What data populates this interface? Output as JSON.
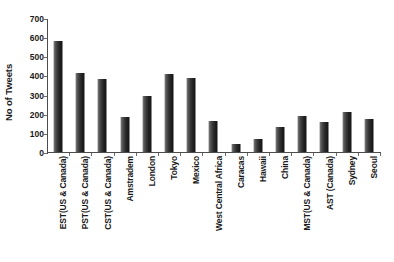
{
  "top_clipped_text": "",
  "chart_data": {
    "type": "bar",
    "title": "",
    "xlabel": "",
    "ylabel": "No of Tweets",
    "ylim": [
      0,
      700
    ],
    "yticks": [
      0,
      100,
      200,
      300,
      400,
      500,
      600,
      700
    ],
    "grid": false,
    "legend": null,
    "bar_color": "#2b2b2b",
    "axis_color": "#4d4d4d",
    "categories": [
      "EST(US & Canada)",
      "PST(US & Canada)",
      "CST(US & Canada)",
      "Amstradem",
      "London",
      "Tokyo",
      "Mexico",
      "West Central Africa",
      "Caracas",
      "Hawaii",
      "China",
      "MST(US & Canada)",
      "AST (Canada)",
      "Sydney",
      "Seoul"
    ],
    "values": [
      578,
      412,
      382,
      185,
      293,
      408,
      388,
      160,
      42,
      68,
      130,
      188,
      155,
      208,
      170
    ]
  }
}
